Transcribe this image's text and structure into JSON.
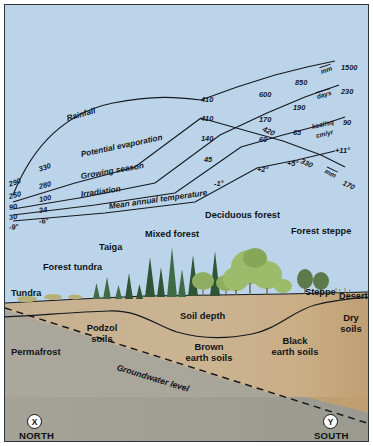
{
  "figure": {
    "colors": {
      "sky": "#bcd4e9",
      "frame": "#2c3440",
      "soil_upper": "#c9b391",
      "soil_lower": "#a9a79c",
      "soil_dry": "#c3a87e",
      "line": "#15191f",
      "conifer": "#3f6b45",
      "broadleaf": "#9fb96a"
    }
  },
  "climate_graph": {
    "rows": [
      {
        "name": "Rainfall",
        "unit": "mm",
        "values": [
          "290",
          "330",
          "410",
          "600",
          "850",
          "1500"
        ]
      },
      {
        "name": "Potential evaporation",
        "unit": "mm",
        "values": [
          "250",
          "280",
          "410",
          "420",
          "330",
          "170"
        ]
      },
      {
        "name": "Growing season",
        "unit": "days",
        "values": [
          "90",
          "100",
          "140",
          "170",
          "190",
          "230"
        ]
      },
      {
        "name": "Irradiation",
        "unit": "kcal/sq cm/yr",
        "values": [
          "30",
          "34",
          "45",
          "60",
          "65",
          "90"
        ]
      },
      {
        "name": "Mean annual temperature",
        "unit": "°C",
        "values": [
          "-9°",
          "-6°",
          "-1°",
          "+2°",
          "+5°",
          "+11°"
        ]
      }
    ],
    "labels": {
      "rainfall": "Rainfall",
      "potential_evaporation": "Potential evaporation",
      "growing_season": "Growing season",
      "irradiation": "Irradiation",
      "mean_annual_temperature": "Mean annual temperature",
      "unit_mm": "mm",
      "unit_days": "days",
      "unit_kcal_a": "kcal/sq",
      "unit_kcal_b": "cm/yr",
      "unit_mm_descending": "mm"
    },
    "left_values": {
      "rainfall_1": "290",
      "rainfall_2": "330",
      "evaporation_1": "250",
      "evaporation_2": "280",
      "growing_1": "90",
      "growing_2": "100",
      "irradiation_1": "30",
      "irradiation_2": "34",
      "temperature_1": "-9°",
      "temperature_2": "-6°"
    },
    "mid_values": {
      "rainfall": "410",
      "evaporation": "410",
      "growing": "140",
      "irradiation": "45",
      "temperature": "-1°"
    },
    "right_values": {
      "rainfall_600": "600",
      "rainfall_850": "850",
      "rainfall_1500": "1500",
      "growing_170": "170",
      "growing_190": "190",
      "growing_230": "230",
      "evaporation_420": "420",
      "evaporation_330": "330",
      "evaporation_170": "170",
      "irradiation_60": "60",
      "irradiation_65": "65",
      "irradiation_90": "90",
      "temperature_p2": "+2°",
      "temperature_p5": "+5°",
      "temperature_p11": "+11°"
    }
  },
  "vegetation": {
    "zones": [
      {
        "label": "Tundra"
      },
      {
        "label": "Forest tundra"
      },
      {
        "label": "Taiga"
      },
      {
        "label": "Mixed forest"
      },
      {
        "label": "Deciduous forest"
      },
      {
        "label": "Forest steppe"
      },
      {
        "label": "Steppe"
      },
      {
        "label": "Desert"
      }
    ]
  },
  "soil": {
    "labels": [
      {
        "label": "Permafrost"
      },
      {
        "label": "Podzol soils"
      },
      {
        "label": "Soil depth"
      },
      {
        "label": "Brown earth soils"
      },
      {
        "label": "Black earth soils"
      },
      {
        "label": "Dry soils"
      },
      {
        "label": "Groundwater level"
      }
    ],
    "permafrost": "Permafrost",
    "podzol_line1": "Podzol",
    "podzol_line2": "soils",
    "soil_depth": "Soil depth",
    "brown_line1": "Brown",
    "brown_line2": "earth soils",
    "black_line1": "Black",
    "black_line2": "earth soils",
    "dry_line1": "Dry",
    "dry_line2": "soils",
    "groundwater": "Groundwater level"
  },
  "axis": {
    "north_marker": "X",
    "north_label": "NORTH",
    "south_marker": "Y",
    "south_label": "SOUTH"
  }
}
